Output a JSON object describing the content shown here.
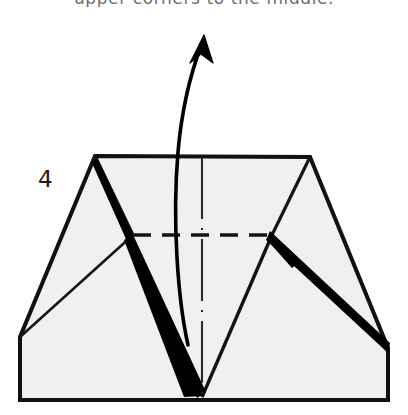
{
  "caption": {
    "text": "upper corners to the middle."
  },
  "figure": {
    "step_number": "4",
    "title": "origami-fold-step-4",
    "colors": {
      "paper_fill": "#f0f0f0",
      "outline": "#111111",
      "crease_solid": "#141414",
      "crease_dashed": "#141414",
      "center_line": "#2a2a2a",
      "wedge_fill": "#000000",
      "arrow": "#000000",
      "caption_text": "#6e6e6e",
      "background": "#ffffff"
    },
    "paper_outline_points": "95,156 310,157 388,348 388,400 20,400 20,337",
    "creases": [
      {
        "name": "left-upper-diagonal",
        "points": "95,156 133,235"
      },
      {
        "name": "left-lower-diagonal",
        "points": "133,235 20,337"
      },
      {
        "name": "right-upper-diagonal",
        "points": "310,157 272,235"
      },
      {
        "name": "right-lower-diagonal",
        "points": "272,235 388,348"
      },
      {
        "name": "left-v-leg",
        "points": "95,156 202,397"
      },
      {
        "name": "right-v-leg",
        "points": "272,235 202,397"
      }
    ],
    "wedges": [
      {
        "name": "left-black-wedge",
        "points": "133,235 202,397 186,397"
      },
      {
        "name": "right-black-wedge",
        "points": "272,233 388,344 388,352"
      },
      {
        "name": "left-v-wedge",
        "points": "100,160 206,392 196,397"
      }
    ],
    "dashed_fold_line": {
      "name": "horizontal-valley-fold",
      "x1": 133,
      "y1": 235,
      "x2": 272,
      "y2": 235
    },
    "center_line": {
      "name": "vertical-center-line",
      "x": 202,
      "y1": 157,
      "y2": 398
    },
    "arrow": {
      "name": "fold-direction-arrow",
      "path": "M 188,345 C 178,300 172,220 178,150 C 182,105 192,70 202,44",
      "head_points": "203,36 212,60 202,53 191,62"
    }
  }
}
